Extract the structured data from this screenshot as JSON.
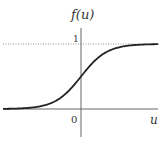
{
  "chart_data": {
    "type": "line",
    "title": "",
    "xlabel": "u",
    "ylabel": "f(u)",
    "function": "sigmoid f(u) = 1 / (1 + e^(-u))",
    "x_tick_labels": [
      "0"
    ],
    "y_tick_labels": [
      "1"
    ],
    "asymptote": {
      "y": 1,
      "style": "dotted"
    },
    "xlim": [
      -6,
      6
    ],
    "ylim": [
      0,
      1
    ],
    "grid": false,
    "legend": null,
    "series": [
      {
        "name": "f(u)",
        "x": [
          -6,
          -5,
          -4,
          -3,
          -2,
          -1,
          0,
          1,
          2,
          3,
          4,
          5,
          6
        ],
        "values": [
          0.002,
          0.007,
          0.018,
          0.047,
          0.119,
          0.269,
          0.5,
          0.731,
          0.881,
          0.953,
          0.982,
          0.993,
          0.998
        ]
      }
    ]
  },
  "labels": {
    "y_axis": "f(u)",
    "x_axis": "u",
    "origin": "0",
    "one": "1"
  },
  "colors": {
    "curve": "#222222",
    "axis": "#555555",
    "dotted": "#777777"
  }
}
